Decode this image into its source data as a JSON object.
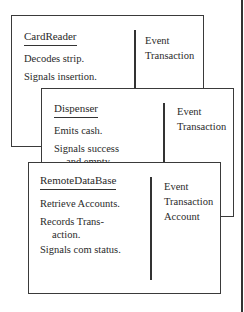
{
  "cards": [
    {
      "name": "CardReader",
      "responsibilities": [
        "Decodes strip.",
        "Signals insertion."
      ],
      "collaborators": [
        "Event",
        "Transaction"
      ]
    },
    {
      "name": "Dispenser",
      "responsibilities": [
        "Emits cash.",
        "Signals success",
        "and empty."
      ],
      "collaborators": [
        "Event",
        "Transaction"
      ]
    },
    {
      "name": "RemoteDataBase",
      "responsibilities": [
        "Retrieve Accounts.",
        "Records Trans-",
        "action.",
        "Signals com status."
      ],
      "collaborators": [
        "Event",
        "Transaction",
        "Account"
      ]
    }
  ]
}
